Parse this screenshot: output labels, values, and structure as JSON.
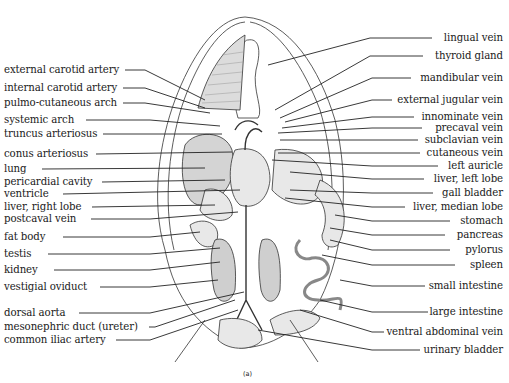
{
  "figure": {
    "caption": "(a)",
    "labels_left": [
      {
        "text": "external carotid artery",
        "y": 70
      },
      {
        "text": "internal carotid artery",
        "y": 88
      },
      {
        "text": "pulmo-cutaneous arch",
        "y": 103
      },
      {
        "text": "systemic arch",
        "y": 120
      },
      {
        "text": "truncus arteriosus",
        "y": 134
      },
      {
        "text": "conus arteriosus",
        "y": 154
      },
      {
        "text": "lung",
        "y": 169
      },
      {
        "text": "pericardial cavity",
        "y": 182
      },
      {
        "text": "ventricle",
        "y": 194
      },
      {
        "text": "liver, right lobe",
        "y": 207
      },
      {
        "text": "postcaval vein",
        "y": 219
      },
      {
        "text": "fat body",
        "y": 237
      },
      {
        "text": "testis",
        "y": 254
      },
      {
        "text": "kidney",
        "y": 270
      },
      {
        "text": "vestigial oviduct",
        "y": 287
      },
      {
        "text": "dorsal aorta",
        "y": 313
      },
      {
        "text": "mesonephric duct  (ureter)",
        "y": 327
      },
      {
        "text": "common iliac artery",
        "y": 340
      }
    ],
    "labels_right": [
      {
        "text": "lingual vein",
        "y": 38
      },
      {
        "text": "thyroid gland",
        "y": 56
      },
      {
        "text": "mandibular vein",
        "y": 78
      },
      {
        "text": "external jugular vein",
        "y": 100
      },
      {
        "text": "innominate vein",
        "y": 117
      },
      {
        "text": "precaval vein",
        "y": 128
      },
      {
        "text": "subclavian vein",
        "y": 140
      },
      {
        "text": "cutaneous vein",
        "y": 153
      },
      {
        "text": "left auricle",
        "y": 166
      },
      {
        "text": "liver, left lobe",
        "y": 179
      },
      {
        "text": "gall bladder",
        "y": 193
      },
      {
        "text": "liver, median lobe",
        "y": 207
      },
      {
        "text": "stomach",
        "y": 221
      },
      {
        "text": "pancreas",
        "y": 235
      },
      {
        "text": "pylorus",
        "y": 250
      },
      {
        "text": "spleen",
        "y": 265
      },
      {
        "text": "small intestine",
        "y": 286
      },
      {
        "text": "large intestine",
        "y": 312
      },
      {
        "text": "ventral abdominal vein",
        "y": 332
      },
      {
        "text": "urinary bladder",
        "y": 350
      }
    ]
  }
}
